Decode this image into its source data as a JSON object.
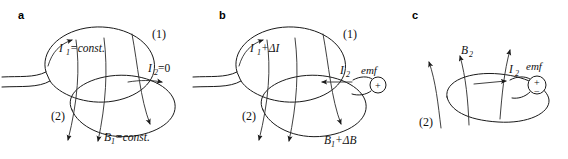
{
  "figure": {
    "background_color": "#ffffff",
    "line_color": "#1a1a1a",
    "width": 568,
    "height": 159
  },
  "panels": [
    {
      "letter": "a",
      "labels": {
        "current_primary": "I",
        "current_primary_sub": "1",
        "current_primary_rest": "=const.",
        "loop_one": "(1)",
        "loop_two": "(2)",
        "current_secondary": "I",
        "current_secondary_sub": "2",
        "current_secondary_rest": "=0",
        "field": "B",
        "field_sub": "1",
        "field_rest": "=const."
      }
    },
    {
      "letter": "b",
      "labels": {
        "current_primary": "I",
        "current_primary_sub": "1",
        "current_primary_rest": "+ΔI",
        "loop_one": "(1)",
        "loop_two": "(2)",
        "current_secondary": "I",
        "current_secondary_sub": "2",
        "emf": "emf",
        "emf_plus": "+",
        "field": "B",
        "field_sub": "1",
        "field_rest": "+ΔB"
      }
    },
    {
      "letter": "c",
      "labels": {
        "field": "B",
        "field_sub": "2",
        "current_secondary": "I",
        "current_secondary_sub": "2",
        "emf": "emf",
        "emf_plus": "+",
        "emf_minus": "−",
        "loop_two": "(2)"
      }
    }
  ]
}
